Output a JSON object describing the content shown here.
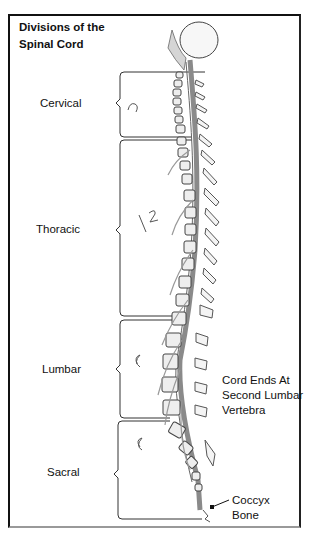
{
  "title": [
    "Divisions of the",
    "Spinal Cord"
  ],
  "divisions": [
    {
      "name": "Cervical",
      "handwritten_count": "7"
    },
    {
      "name": "Thoracic",
      "handwritten_count": "12"
    },
    {
      "name": "Lumbar",
      "handwritten_count": "5"
    },
    {
      "name": "Sacral",
      "handwritten_count": "5"
    }
  ],
  "annotations": {
    "cord_end": [
      "Cord Ends At",
      "Second Lumbar",
      "Vertebra"
    ],
    "coccyx": [
      "Coccyx",
      "Bone"
    ]
  },
  "colors": {
    "line": "#111111",
    "cord": "#8a8a8a",
    "bone_fill": "#e6e6e6"
  }
}
